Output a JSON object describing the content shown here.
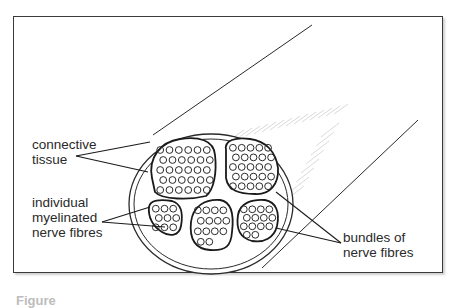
{
  "labels": {
    "connective_tissue": "connective\ntissue",
    "myelinated_fibres": "individual\nmyelinated\nnerve fibres",
    "bundles": "bundles of\nnerve fibres"
  },
  "caption": "Figure",
  "colors": {
    "ink": "#2a2a2a",
    "frame": "#3a3a3a",
    "hatch": "#c8c8c8"
  },
  "bundles": [
    {
      "name": "bundle-top-left",
      "fibre_count": 30
    },
    {
      "name": "bundle-top-right",
      "fibre_count": 25
    },
    {
      "name": "bundle-bottom-left",
      "fibre_count": 9
    },
    {
      "name": "bundle-bottom-middle",
      "fibre_count": 14
    },
    {
      "name": "bundle-bottom-right",
      "fibre_count": 14
    }
  ]
}
